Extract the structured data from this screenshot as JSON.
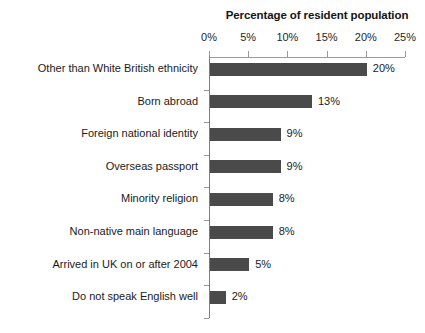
{
  "chart_data": {
    "type": "bar",
    "orientation": "horizontal",
    "title": "Percentage of resident population",
    "xlabel": "",
    "ylabel": "",
    "xlim": [
      0,
      25
    ],
    "xticks": [
      0,
      5,
      10,
      15,
      20,
      25
    ],
    "xtick_labels": [
      "0%",
      "5%",
      "10%",
      "15%",
      "20%",
      "25%"
    ],
    "grid": false,
    "legend": false,
    "bar_color": "#4a4a4a",
    "background_color": "#ffffff",
    "categories": [
      "Other than White British ethnicity",
      "Born abroad",
      "Foreign national identity",
      "Overseas passport",
      "Minority religion",
      "Non-native main language",
      "Arrived in UK on or after 2004",
      "Do not speak English well"
    ],
    "values": [
      20,
      13,
      9,
      9,
      8,
      8,
      5,
      2
    ],
    "data_labels": [
      "20%",
      "13%",
      "9%",
      "9%",
      "8%",
      "8%",
      "5%",
      "2%"
    ]
  }
}
